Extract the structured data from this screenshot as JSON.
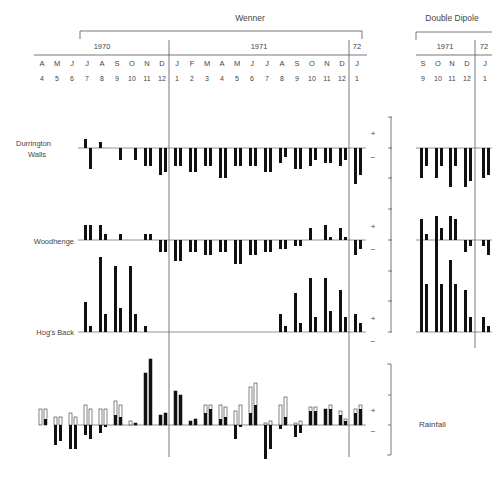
{
  "chart_data": {
    "type": "bar",
    "title": "",
    "groups": [
      {
        "name": "Wenner",
        "periods": [
          {
            "label": "1970"
          },
          {
            "label": "1971"
          },
          {
            "label": "72"
          }
        ]
      },
      {
        "name": "Double Dipole",
        "periods": [
          {
            "label": "1971"
          },
          {
            "label": "72"
          }
        ]
      }
    ],
    "wenner_months": {
      "letters": [
        "A",
        "M",
        "J",
        "J",
        "A",
        "S",
        "O",
        "N",
        "D",
        "J",
        "F",
        "M",
        "A",
        "M",
        "J",
        "J",
        "A",
        "S",
        "O",
        "N",
        "D",
        "J"
      ],
      "numbers": [
        "4",
        "5",
        "6",
        "7",
        "8",
        "9",
        "10",
        "11",
        "12",
        "1",
        "2",
        "3",
        "4",
        "5",
        "6",
        "7",
        "8",
        "9",
        "10",
        "11",
        "12",
        "1"
      ]
    },
    "dd_months": {
      "letters": [
        "S",
        "O",
        "N",
        "D",
        "J"
      ],
      "numbers": [
        "9",
        "10",
        "11",
        "12",
        "1"
      ]
    },
    "scale_signs": {
      "plus": "+",
      "minus": "−"
    },
    "series": [
      {
        "name": "Durrington Walls",
        "label_lines": [
          "Durrington",
          "Walls"
        ],
        "wenner": [
          [
            0,
            0
          ],
          [
            0,
            0
          ],
          [
            0,
            0
          ],
          [
            3,
            -7
          ],
          [
            2,
            0
          ],
          [
            0,
            -4
          ],
          [
            0,
            -4
          ],
          [
            -6,
            -6
          ],
          [
            -9,
            -8
          ],
          [
            -6,
            -6
          ],
          [
            -8,
            -8
          ],
          [
            -6,
            -6
          ],
          [
            -10,
            -10
          ],
          [
            -6,
            -6
          ],
          [
            -6,
            -6
          ],
          [
            -8,
            -8
          ],
          [
            -5,
            -3
          ],
          [
            -7,
            -7
          ],
          [
            -6,
            -4
          ],
          [
            -5,
            -5
          ],
          [
            -6,
            -4
          ],
          [
            -12,
            -9
          ],
          [
            -7,
            -8
          ]
        ],
        "dd": [
          [
            -10,
            -6
          ],
          [
            -10,
            -6
          ],
          [
            -13,
            -6
          ],
          [
            -13,
            -11
          ],
          [
            -10,
            -9
          ]
        ]
      },
      {
        "name": "Woodhenge",
        "label_lines": [
          "Woodhenge"
        ],
        "wenner": [
          [
            0,
            0
          ],
          [
            0,
            0
          ],
          [
            0,
            0
          ],
          [
            5,
            5
          ],
          [
            5,
            2
          ],
          [
            0,
            2
          ],
          [
            0,
            0
          ],
          [
            2,
            2
          ],
          [
            -4,
            -4
          ],
          [
            -7,
            -7
          ],
          [
            -4,
            -4
          ],
          [
            -5,
            -5
          ],
          [
            -4,
            -4
          ],
          [
            -8,
            -8
          ],
          [
            -5,
            -5
          ],
          [
            -4,
            -4
          ],
          [
            -3,
            -3
          ],
          [
            -2,
            -2
          ],
          [
            4,
            0
          ],
          [
            5,
            1
          ],
          [
            4,
            1
          ],
          [
            -5,
            -3
          ],
          [
            -5,
            -5
          ]
        ],
        "dd": [
          [
            7,
            2
          ],
          [
            8,
            4
          ],
          [
            8,
            7
          ],
          [
            -4,
            -2
          ],
          [
            -2,
            -5
          ]
        ]
      },
      {
        "name": "Hog's Back",
        "label_lines": [
          "Hog's Back"
        ],
        "wenner": [
          [
            0,
            0
          ],
          [
            0,
            0
          ],
          [
            0,
            0
          ],
          [
            10,
            2
          ],
          [
            25,
            6
          ],
          [
            22,
            8
          ],
          [
            22,
            6
          ],
          [
            2,
            0
          ],
          [
            0,
            0
          ],
          [
            0,
            0
          ],
          [
            0,
            0
          ],
          [
            0,
            0
          ],
          [
            0,
            0
          ],
          [
            0,
            0
          ],
          [
            0,
            0
          ],
          [
            0,
            0
          ],
          [
            6,
            2
          ],
          [
            13,
            3
          ],
          [
            18,
            5
          ],
          [
            18,
            7
          ],
          [
            14,
            5
          ],
          [
            6,
            3
          ],
          [
            0,
            0
          ]
        ],
        "dd": [
          [
            31,
            16
          ],
          [
            32,
            16
          ],
          [
            24,
            16
          ],
          [
            14,
            5
          ],
          [
            5,
            2
          ]
        ]
      },
      {
        "name": "Rainfall",
        "label_lines": [
          "Rainfall"
        ],
        "wenner_total": [
          [
            0,
            0
          ],
          [
            0,
            0
          ],
          [
            0,
            0
          ],
          [
            8,
            8
          ],
          [
            4,
            4
          ],
          [
            6,
            4
          ],
          [
            10,
            8
          ],
          [
            8,
            8
          ],
          [
            12,
            10
          ],
          [
            2,
            1
          ],
          [
            26,
            33
          ],
          [
            5,
            6
          ],
          [
            17,
            15
          ],
          [
            2,
            3
          ],
          [
            10,
            10
          ],
          [
            10,
            9
          ],
          [
            7,
            10
          ],
          [
            19,
            21
          ],
          [
            1,
            2
          ],
          [
            10,
            14
          ],
          [
            1,
            2
          ],
          [
            9,
            9
          ],
          [
            8,
            10
          ],
          [
            7,
            3
          ],
          [
            8,
            10
          ]
        ],
        "wenner_actual": [
          [
            0,
            0
          ],
          [
            0,
            0
          ],
          [
            0,
            0
          ],
          [
            0,
            3
          ],
          [
            -10,
            -8
          ],
          [
            -12,
            -12
          ],
          [
            -5,
            -7
          ],
          [
            -4,
            -1
          ],
          [
            5,
            4
          ],
          [
            0,
            1
          ],
          [
            26,
            33
          ],
          [
            5,
            6
          ],
          [
            17,
            15
          ],
          [
            2,
            3
          ],
          [
            6,
            8
          ],
          [
            3,
            4
          ],
          [
            -7,
            -1
          ],
          [
            6,
            10
          ],
          [
            -17,
            -12
          ],
          [
            -2,
            4
          ],
          [
            -6,
            -4
          ],
          [
            7,
            7
          ],
          [
            8,
            8
          ],
          [
            5,
            2
          ],
          [
            6,
            8
          ]
        ]
      }
    ]
  }
}
